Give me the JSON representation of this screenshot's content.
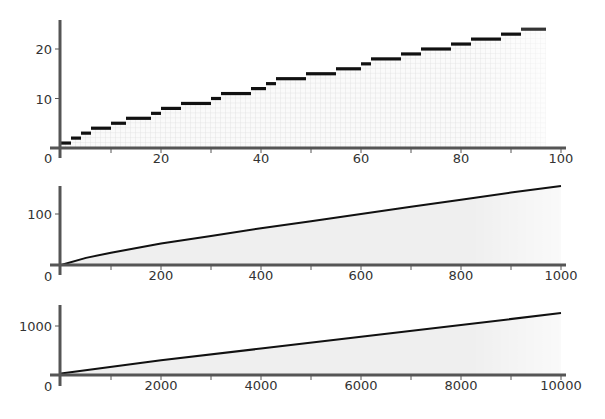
{
  "chart_data": [
    {
      "type": "line",
      "subtype": "step",
      "title": "",
      "xlabel": "",
      "ylabel": "",
      "xlim": [
        0,
        100
      ],
      "ylim": [
        0,
        25
      ],
      "xticks": [
        0,
        20,
        40,
        60,
        80,
        100
      ],
      "yticks": [
        10,
        20
      ],
      "grid": true,
      "fill_under": true,
      "steps": [
        {
          "x0": 0,
          "x1": 2,
          "y": 1
        },
        {
          "x0": 2,
          "x1": 4,
          "y": 2
        },
        {
          "x0": 4,
          "x1": 6,
          "y": 3
        },
        {
          "x0": 6,
          "x1": 10,
          "y": 4
        },
        {
          "x0": 10,
          "x1": 13,
          "y": 5
        },
        {
          "x0": 13,
          "x1": 18,
          "y": 6
        },
        {
          "x0": 18,
          "x1": 20,
          "y": 7
        },
        {
          "x0": 20,
          "x1": 24,
          "y": 8
        },
        {
          "x0": 24,
          "x1": 30,
          "y": 9
        },
        {
          "x0": 30,
          "x1": 32,
          "y": 10
        },
        {
          "x0": 32,
          "x1": 38,
          "y": 11
        },
        {
          "x0": 38,
          "x1": 41,
          "y": 12
        },
        {
          "x0": 41,
          "x1": 43,
          "y": 13
        },
        {
          "x0": 43,
          "x1": 49,
          "y": 14
        },
        {
          "x0": 49,
          "x1": 55,
          "y": 15
        },
        {
          "x0": 55,
          "x1": 60,
          "y": 16
        },
        {
          "x0": 60,
          "x1": 62,
          "y": 17
        },
        {
          "x0": 62,
          "x1": 68,
          "y": 18
        },
        {
          "x0": 68,
          "x1": 72,
          "y": 19
        },
        {
          "x0": 72,
          "x1": 78,
          "y": 20
        },
        {
          "x0": 78,
          "x1": 82,
          "y": 21
        },
        {
          "x0": 82,
          "x1": 88,
          "y": 22
        },
        {
          "x0": 88,
          "x1": 92,
          "y": 23
        },
        {
          "x0": 92,
          "x1": 97,
          "y": 24
        }
      ]
    },
    {
      "type": "line",
      "title": "",
      "xlabel": "",
      "ylabel": "",
      "xlim": [
        0,
        1000
      ],
      "ylim": [
        0,
        160
      ],
      "xticks": [
        0,
        200,
        400,
        600,
        800,
        1000
      ],
      "yticks": [
        100
      ],
      "grid": false,
      "fill_under": true,
      "x": [
        0,
        50,
        100,
        200,
        300,
        400,
        500,
        600,
        700,
        800,
        900,
        1000
      ],
      "y": [
        0,
        14,
        24,
        42,
        57,
        72,
        86,
        100,
        114,
        128,
        142,
        155
      ]
    },
    {
      "type": "line",
      "title": "",
      "xlabel": "",
      "ylabel": "",
      "xlim": [
        0,
        10000
      ],
      "ylim": [
        0,
        1400
      ],
      "xticks": [
        0,
        2000,
        4000,
        6000,
        8000,
        10000
      ],
      "yticks": [
        1000
      ],
      "grid": false,
      "fill_under": true,
      "x": [
        0,
        2000,
        4000,
        6000,
        8000,
        10000
      ],
      "y": [
        30,
        300,
        540,
        780,
        1020,
        1265
      ]
    }
  ],
  "panels": [
    {
      "origin_label": "0",
      "xtick_labels": [
        "20",
        "40",
        "60",
        "80",
        "100"
      ],
      "ytick_labels": [
        "10",
        "20"
      ]
    },
    {
      "origin_label": "0",
      "xtick_labels": [
        "200",
        "400",
        "600",
        "800",
        "1000"
      ],
      "ytick_labels": [
        "100"
      ]
    },
    {
      "origin_label": "0",
      "xtick_labels": [
        "2000",
        "4000",
        "6000",
        "8000",
        "10000"
      ],
      "ytick_labels": [
        "1000"
      ]
    }
  ],
  "colors": {
    "line": "#111111",
    "axis": "#555555",
    "fill": "#f0f0f0",
    "grid": "#d8d8d8",
    "label": "#333333"
  }
}
